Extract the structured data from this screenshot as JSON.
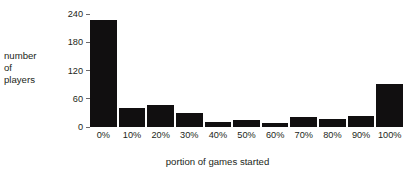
{
  "chart_data": {
    "type": "bar",
    "title": "",
    "xlabel": "portion of games started",
    "ylabel": "number of players",
    "ylabel_lines": [
      "number",
      "of",
      "players"
    ],
    "categories": [
      "0%",
      "10%",
      "20%",
      "30%",
      "40%",
      "50%",
      "60%",
      "70%",
      "80%",
      "90%",
      "100%"
    ],
    "values": [
      227,
      40,
      47,
      29,
      10,
      15,
      8,
      21,
      17,
      23,
      91
    ],
    "yticks": [
      0,
      60,
      120,
      180,
      240
    ],
    "ytick_labels": [
      "0",
      "60",
      "120",
      "180",
      "240"
    ],
    "ylim": [
      0,
      240
    ],
    "grid": false,
    "legend": false,
    "bar_color": "#110f10",
    "background_color": "#ffffff",
    "text_color": "#231f20"
  }
}
